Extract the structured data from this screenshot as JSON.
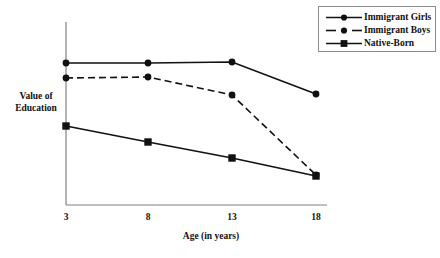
{
  "chart_data": {
    "type": "line",
    "title": "",
    "subtitle": "",
    "xlabel": "Age (in years)",
    "ylabel": "Value of Education",
    "ylabel_line1": "Value of",
    "ylabel_line2": "Education",
    "categories": [
      "3",
      "8",
      "13",
      "18"
    ],
    "x": [
      3,
      8,
      13,
      18
    ],
    "xlim": [
      3,
      18
    ],
    "ylim": [
      0,
      100
    ],
    "y_axis_ticks": [],
    "y_axis_tick_labels": [],
    "grid": false,
    "legend_position": "top-right",
    "axis_color": "#808080",
    "line_color": "#111111",
    "series": [
      {
        "name": "Immigrant Girls",
        "style": "solid",
        "marker": "circle",
        "color": "#111111",
        "values": [
          78,
          78,
          78.5,
          61
        ],
        "pixel_y": [
          63,
          63,
          62,
          94
        ]
      },
      {
        "name": "Immigrant Boys",
        "style": "dashed",
        "marker": "circle",
        "color": "#111111",
        "values": [
          70,
          70.5,
          60.5,
          16.5
        ],
        "pixel_y": [
          78,
          77,
          95,
          175
        ]
      },
      {
        "name": "Native-Born",
        "style": "solid",
        "marker": "square",
        "color": "#111111",
        "values": [
          43,
          34.5,
          25.5,
          16
        ],
        "pixel_y": [
          126,
          142,
          158,
          176
        ]
      }
    ]
  },
  "legend": {
    "items": [
      {
        "label": "Immigrant Girls",
        "style": "solid",
        "marker": "circle"
      },
      {
        "label": "Immigrant Boys",
        "style": "dashed",
        "marker": "circle"
      },
      {
        "label": "Native-Born",
        "style": "solid",
        "marker": "square"
      }
    ]
  },
  "axes": {
    "x_tick_labels": [
      "3",
      "8",
      "13",
      "18"
    ],
    "x_title": "Age (in years)",
    "y_title_line1": "Value of",
    "y_title_line2": "Education"
  }
}
